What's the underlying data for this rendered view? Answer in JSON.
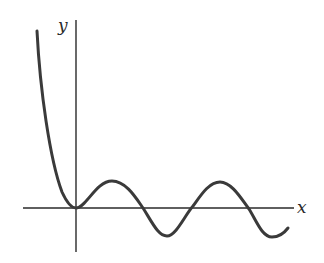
{
  "figure": {
    "x_axis_label": "x",
    "y_axis_label": "y",
    "axis_color": "#2a2a2a",
    "curve_color": "#3a3a3a"
  }
}
